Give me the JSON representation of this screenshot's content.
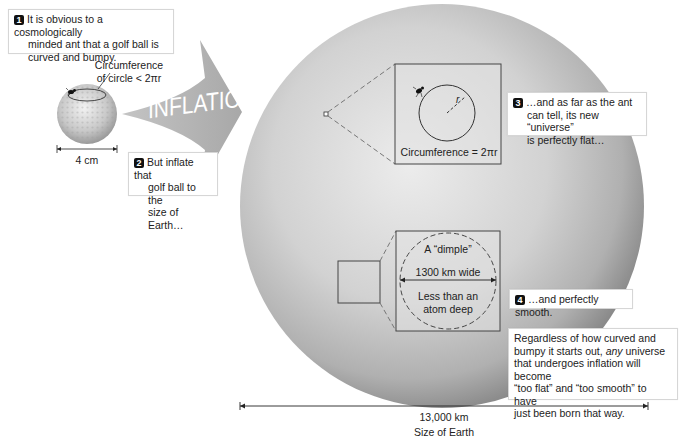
{
  "callouts": {
    "c1": {
      "number": "1",
      "line1": "It is obvious to a cosmologically",
      "line2": "minded ant that a golf ball is",
      "line3": "curved and bumpy."
    },
    "c2": {
      "number": "2",
      "line1": "But inflate that",
      "line2": "golf ball to the",
      "line3": "size of Earth…"
    },
    "c3": {
      "number": "3",
      "line1": "…and as far as the ant",
      "line2": "can tell, its new “universe”",
      "line3": "is perfectly flat…"
    },
    "c4": {
      "number": "4",
      "line1": "…and perfectly smooth."
    },
    "summary": {
      "line1": "Regardless of how curved and",
      "line2_pre": "bumpy it starts out, ",
      "line2_em": "any",
      "line2_post": " universe",
      "line3": "that undergoes inflation will become",
      "line4": "“too flat” and “too smooth” to have",
      "line5": "just been born that way."
    }
  },
  "golf_ball": {
    "circ_label_1": "Circumference",
    "circ_label_2": "of circle < 2πr",
    "size_label": "4 cm"
  },
  "arrow": {
    "label": "INFLATION"
  },
  "inset_flat": {
    "radius_label": "r",
    "circ_label": "Circumference = 2πr"
  },
  "inset_dimple": {
    "title": "A “dimple”",
    "width_label": "1300 km wide",
    "depth_line1": "Less than an",
    "depth_line2": "atom deep"
  },
  "earth": {
    "size_value": "13,000 km",
    "size_label": "Size of Earth"
  },
  "colors": {
    "sphere_light": "#e6e6e6",
    "sphere_dark": "#8c8c8c",
    "arrow": "#b4b4b4",
    "badge": "#111111"
  }
}
